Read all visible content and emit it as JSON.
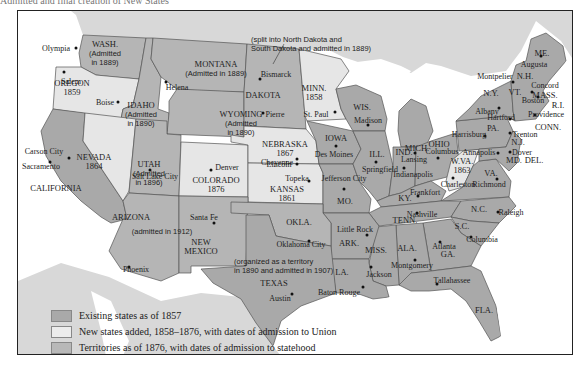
{
  "caption_fragment": "Admitted and final creation of New States",
  "colors": {
    "existing": "#a9a9a9",
    "new": "#e6e6e6",
    "territory": "#b8b8b8",
    "foreign": "#d6d6d6",
    "water": "#ffffff",
    "border": "#555555"
  },
  "legend": {
    "items": [
      {
        "label": "Existing states as of 1857",
        "swatch": "#a9a9a9"
      },
      {
        "label": "New states added, 1858–1876, with dates of admission to Union",
        "swatch": "#e8e8e8"
      },
      {
        "label": "Territories as of 1876, with dates of admission to statehood",
        "swatch": "#b8b8b8"
      },
      {
        "label": "State and terrional capitals",
        "swatch": "dot"
      }
    ]
  },
  "annotations": {
    "dakota_note": [
      "(split into North Dakota and",
      "South Dakota and admitted in 1889)"
    ],
    "oklahoma_note": [
      "(organized as a territory",
      "in 1890 and admitted in 1907)"
    ]
  },
  "regions": [
    {
      "name": "WASH.",
      "sub": [
        "(Admitted",
        "in 1889)"
      ],
      "type": "territory",
      "x": 104,
      "y": 52
    },
    {
      "name": "OREGON",
      "sub": [
        "1859"
      ],
      "type": "new",
      "x": 71,
      "y": 87
    },
    {
      "name": "IDAHO",
      "sub": [
        "(Admitted",
        "in 1890)"
      ],
      "type": "territory",
      "x": 140,
      "y": 113
    },
    {
      "name": "MONTANA",
      "sub": [
        "(Admitted in 1889)"
      ],
      "type": "territory",
      "x": 215,
      "y": 68
    },
    {
      "name": "WYOMING",
      "sub": [
        "(Admitted",
        "in 1890)"
      ],
      "type": "territory",
      "x": 240,
      "y": 122
    },
    {
      "name": "DAKOTA",
      "sub": [],
      "type": "territory",
      "x": 262,
      "y": 94
    },
    {
      "name": "MINN.",
      "sub": [
        "1858"
      ],
      "type": "new",
      "x": 313,
      "y": 92
    },
    {
      "name": "WIS.",
      "sub": [],
      "type": "existing",
      "x": 361,
      "y": 106
    },
    {
      "name": "MICH.",
      "sub": [],
      "type": "existing",
      "x": 416,
      "y": 147
    },
    {
      "name": "NEVADA",
      "sub": [
        "1864"
      ],
      "type": "new",
      "x": 93,
      "y": 161
    },
    {
      "name": "CALIFORNIA",
      "sub": [],
      "type": "existing",
      "x": 55,
      "y": 187
    },
    {
      "name": "UTAH",
      "sub": [
        "(Admitted",
        "in 1896)"
      ],
      "type": "territory",
      "x": 148,
      "y": 172
    },
    {
      "name": "COLORADO",
      "sub": [
        "1876"
      ],
      "type": "new",
      "x": 215,
      "y": 184
    },
    {
      "name": "NEBRASKA",
      "sub": [
        "1867"
      ],
      "type": "new",
      "x": 284,
      "y": 148
    },
    {
      "name": "KANSAS",
      "sub": [
        "1861"
      ],
      "type": "new",
      "x": 286,
      "y": 193
    },
    {
      "name": "IOWA",
      "sub": [],
      "type": "existing",
      "x": 335,
      "y": 137
    },
    {
      "name": "ILL.",
      "sub": [],
      "type": "existing",
      "x": 376,
      "y": 153
    },
    {
      "name": "IND.",
      "sub": [],
      "type": "existing",
      "x": 403,
      "y": 151
    },
    {
      "name": "OHIO",
      "sub": [],
      "type": "existing",
      "x": 438,
      "y": 143
    },
    {
      "name": "MO.",
      "sub": [],
      "type": "existing",
      "x": 344,
      "y": 200
    },
    {
      "name": "KY.",
      "sub": [],
      "type": "existing",
      "x": 404,
      "y": 197
    },
    {
      "name": "W.VA.",
      "sub": [
        "1863"
      ],
      "type": "new",
      "x": 461,
      "y": 165
    },
    {
      "name": "VA.",
      "sub": [],
      "type": "existing",
      "x": 490,
      "y": 172
    },
    {
      "name": "PA.",
      "sub": [],
      "type": "existing",
      "x": 492,
      "y": 127
    },
    {
      "name": "N.Y.",
      "sub": [],
      "type": "existing",
      "x": 490,
      "y": 92
    },
    {
      "name": "VT.",
      "sub": [],
      "type": "existing",
      "x": 514,
      "y": 91
    },
    {
      "name": "N.H.",
      "sub": [],
      "type": "existing",
      "x": 524,
      "y": 75
    },
    {
      "name": "ME.",
      "sub": [],
      "type": "existing",
      "x": 541,
      "y": 52
    },
    {
      "name": "MASS.",
      "sub": [],
      "type": "existing",
      "x": 544,
      "y": 94
    },
    {
      "name": "R.I.",
      "sub": [],
      "type": "existing",
      "x": 557,
      "y": 104
    },
    {
      "name": "CONN.",
      "sub": [],
      "type": "existing",
      "x": 547,
      "y": 126
    },
    {
      "name": "N.J.",
      "sub": [],
      "type": "existing",
      "x": 517,
      "y": 141
    },
    {
      "name": "DEL.",
      "sub": [],
      "type": "existing",
      "x": 533,
      "y": 159
    },
    {
      "name": "MD.",
      "sub": [],
      "type": "existing",
      "x": 513,
      "y": 159
    },
    {
      "name": "TENN.",
      "sub": [],
      "type": "existing",
      "x": 404,
      "y": 219
    },
    {
      "name": "N.C.",
      "sub": [],
      "type": "existing",
      "x": 478,
      "y": 208
    },
    {
      "name": "S.C.",
      "sub": [],
      "type": "existing",
      "x": 461,
      "y": 225
    },
    {
      "name": "ARIZONA",
      "sub": [],
      "type": "territory",
      "x": 130,
      "y": 216
    },
    {
      "name": "(admitted in 1912)",
      "sub": [],
      "type": "territory-note",
      "x": 161,
      "y": 230
    },
    {
      "name": "NEW",
      "sub": [
        "MEXICO"
      ],
      "type": "territory",
      "x": 200,
      "y": 246
    },
    {
      "name": "OKLA.",
      "sub": [],
      "type": "territory",
      "x": 298,
      "y": 221
    },
    {
      "name": "ARK.",
      "sub": [],
      "type": "existing",
      "x": 348,
      "y": 242
    },
    {
      "name": "TEXAS",
      "sub": [],
      "type": "existing",
      "x": 273,
      "y": 282
    },
    {
      "name": "LA.",
      "sub": [],
      "type": "existing",
      "x": 341,
      "y": 271
    },
    {
      "name": "MISS.",
      "sub": [],
      "type": "existing",
      "x": 375,
      "y": 249
    },
    {
      "name": "ALA.",
      "sub": [],
      "type": "existing",
      "x": 406,
      "y": 247
    },
    {
      "name": "GA.",
      "sub": [],
      "type": "existing",
      "x": 447,
      "y": 253
    },
    {
      "name": "FLA.",
      "sub": [],
      "type": "existing",
      "x": 483,
      "y": 309
    }
  ],
  "capitals": [
    {
      "name": "Olympia",
      "x": 75,
      "y": 47,
      "lx": 55,
      "ly": 47
    },
    {
      "name": "Salem",
      "x": 63,
      "y": 71,
      "lx": 70,
      "ly": 80
    },
    {
      "name": "Boise",
      "x": 117,
      "y": 101,
      "lx": 104,
      "ly": 101
    },
    {
      "name": "Helena",
      "x": 165,
      "y": 81,
      "lx": 176,
      "ly": 86
    },
    {
      "name": "Bismarck",
      "x": 259,
      "y": 78,
      "lx": 275,
      "ly": 73
    },
    {
      "name": "Pierre",
      "x": 262,
      "y": 112,
      "lx": 274,
      "ly": 113
    },
    {
      "name": "St. Paul",
      "x": 334,
      "y": 111,
      "lx": 315,
      "ly": 113
    },
    {
      "name": "Madison",
      "x": 367,
      "y": 124,
      "lx": 367,
      "ly": 119
    },
    {
      "name": "Lansing",
      "x": 414,
      "y": 152,
      "lx": 413,
      "ly": 158
    },
    {
      "name": "Cheyenne",
      "x": 296,
      "y": 163,
      "lx": 276,
      "ly": 161
    },
    {
      "name": "Carson City",
      "x": 68,
      "y": 157,
      "lx": 43,
      "ly": 150
    },
    {
      "name": "Sacramento",
      "x": 49,
      "y": 161,
      "lx": 40,
      "ly": 165
    },
    {
      "name": "Salt Lake City",
      "x": 149,
      "y": 169,
      "lx": 154,
      "ly": 175
    },
    {
      "name": "Denver",
      "x": 210,
      "y": 169,
      "lx": 226,
      "ly": 166
    },
    {
      "name": "Lincoln",
      "x": 296,
      "y": 158,
      "lx": 278,
      "ly": 163
    },
    {
      "name": "Des Moines",
      "x": 335,
      "y": 145,
      "lx": 333,
      "ly": 153
    },
    {
      "name": "Springfield",
      "x": 375,
      "y": 161,
      "lx": 379,
      "ly": 168
    },
    {
      "name": "Indianapolis",
      "x": 403,
      "y": 167,
      "lx": 412,
      "ly": 173
    },
    {
      "name": "Columbus",
      "x": 437,
      "y": 157,
      "lx": 441,
      "ly": 150
    },
    {
      "name": "Topeka",
      "x": 308,
      "y": 180,
      "lx": 296,
      "ly": 177
    },
    {
      "name": "Jefferson City",
      "x": 343,
      "y": 188,
      "lx": 343,
      "ly": 177
    },
    {
      "name": "Frankfort",
      "x": 417,
      "y": 195,
      "lx": 424,
      "ly": 191
    },
    {
      "name": "Charleston",
      "x": 452,
      "y": 177,
      "lx": 457,
      "ly": 183
    },
    {
      "name": "Richmond",
      "x": 496,
      "y": 178,
      "lx": 488,
      "ly": 183
    },
    {
      "name": "Harrisburg",
      "x": 484,
      "y": 135,
      "lx": 468,
      "ly": 133
    },
    {
      "name": "Annapolis",
      "x": 497,
      "y": 152,
      "lx": 478,
      "ly": 151
    },
    {
      "name": "Dover",
      "x": 509,
      "y": 151,
      "lx": 521,
      "ly": 151
    },
    {
      "name": "Trenton",
      "x": 509,
      "y": 132,
      "lx": 524,
      "ly": 133
    },
    {
      "name": "Albany",
      "x": 498,
      "y": 107,
      "lx": 486,
      "ly": 110
    },
    {
      "name": "Hartford",
      "x": 509,
      "y": 118,
      "lx": 500,
      "ly": 116
    },
    {
      "name": "Providence",
      "x": 534,
      "y": 114,
      "lx": 545,
      "ly": 113
    },
    {
      "name": "Boston",
      "x": 537,
      "y": 96,
      "lx": 532,
      "ly": 99
    },
    {
      "name": "Concord",
      "x": 531,
      "y": 91,
      "lx": 544,
      "ly": 84
    },
    {
      "name": "Montpelier",
      "x": 512,
      "y": 81,
      "lx": 494,
      "ly": 75
    },
    {
      "name": "Augusta",
      "x": 540,
      "y": 55,
      "lx": 533,
      "ly": 63
    },
    {
      "name": "Santa Fe",
      "x": 213,
      "y": 222,
      "lx": 203,
      "ly": 216
    },
    {
      "name": "Phoenix",
      "x": 128,
      "y": 266,
      "lx": 135,
      "ly": 268
    },
    {
      "name": "Oklahoma City",
      "x": 308,
      "y": 240,
      "lx": 300,
      "ly": 243
    },
    {
      "name": "Little Rock",
      "x": 366,
      "y": 234,
      "lx": 354,
      "ly": 228
    },
    {
      "name": "Nashville",
      "x": 416,
      "y": 212,
      "lx": 421,
      "ly": 213
    },
    {
      "name": "Raleigh",
      "x": 497,
      "y": 211,
      "lx": 510,
      "ly": 211
    },
    {
      "name": "Columbia",
      "x": 470,
      "y": 236,
      "lx": 481,
      "ly": 238
    },
    {
      "name": "Atlanta",
      "x": 439,
      "y": 241,
      "lx": 443,
      "ly": 245
    },
    {
      "name": "Montgomery",
      "x": 414,
      "y": 259,
      "lx": 411,
      "ly": 264
    },
    {
      "name": "Jackson",
      "x": 370,
      "y": 266,
      "lx": 378,
      "ly": 273
    },
    {
      "name": "Baton Rouge",
      "x": 362,
      "y": 286,
      "lx": 338,
      "ly": 291
    },
    {
      "name": "Tallahassee",
      "x": 436,
      "y": 283,
      "lx": 451,
      "ly": 279
    },
    {
      "name": "Austin",
      "x": 291,
      "y": 293,
      "lx": 279,
      "ly": 297
    }
  ]
}
